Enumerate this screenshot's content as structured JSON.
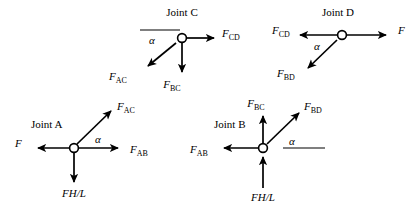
{
  "figure": {
    "type": "free-body-diagram",
    "background_color": "#ffffff",
    "line_color": "#000000",
    "angle_symbol": "α"
  },
  "joints": {
    "c": {
      "title": "Joint C",
      "node": {
        "x": 182,
        "y": 38
      },
      "forces": [
        {
          "name": "F_CD",
          "base": "F",
          "sub": "CD",
          "label_x": 222,
          "label_y": 37,
          "direction": "right",
          "tip_x": 214,
          "tip_y": 38
        },
        {
          "name": "F_BC",
          "base": "F",
          "sub": "BC",
          "label_x": 172,
          "label_y": 88,
          "direction": "down",
          "tip_x": 182,
          "tip_y": 72
        },
        {
          "name": "F_AC",
          "base": "F",
          "sub": "AC",
          "label_x": 118,
          "label_y": 80,
          "direction": "down-left",
          "tip_x": 148,
          "tip_y": 66
        }
      ],
      "angle": {
        "symbol": "α",
        "x": 149,
        "y": 44,
        "ref_line_from_x": 140,
        "ref_line_to_x": 180,
        "ref_line_y": 30
      }
    },
    "d": {
      "title": "Joint D",
      "node": {
        "x": 342,
        "y": 35
      },
      "forces": [
        {
          "name": "F",
          "base": "F",
          "sub": "",
          "label_x": 398,
          "label_y": 34,
          "direction": "right",
          "tip_x": 386,
          "tip_y": 35
        },
        {
          "name": "F_CD",
          "base": "F",
          "sub": "CD",
          "label_x": 272,
          "label_y": 34,
          "direction": "left",
          "tip_x": 300,
          "tip_y": 35
        },
        {
          "name": "F_BD",
          "base": "F",
          "sub": "BD",
          "label_x": 277,
          "label_y": 76,
          "direction": "down-left",
          "tip_x": 308,
          "tip_y": 68
        }
      ],
      "angle": {
        "symbol": "α",
        "x": 315,
        "y": 49,
        "ref_line_from_x": 300,
        "ref_line_to_x": 340,
        "ref_line_y": 35
      }
    },
    "a": {
      "title": "Joint A",
      "title_x": 31,
      "title_y": 128,
      "node": {
        "x": 74,
        "y": 148
      },
      "forces": [
        {
          "name": "F",
          "base": "F",
          "sub": "",
          "label_x": 15,
          "label_y": 147,
          "direction": "left",
          "tip_x": 38,
          "tip_y": 148
        },
        {
          "name": "F_AB",
          "base": "F",
          "sub": "AB",
          "label_x": 132,
          "label_y": 152,
          "direction": "right",
          "tip_x": 118,
          "tip_y": 148
        },
        {
          "name": "F_AC",
          "base": "F",
          "sub": "AC",
          "label_x": 119,
          "label_y": 111,
          "direction": "up-right",
          "tip_x": 111,
          "tip_y": 111
        },
        {
          "name": "FH/L",
          "base": "FH/L",
          "sub": "",
          "label_x": 57,
          "label_y": 196,
          "direction": "down",
          "tip_x": 74,
          "tip_y": 182
        }
      ],
      "angle": {
        "symbol": "α",
        "x": 99,
        "y": 142
      }
    },
    "b": {
      "title": "Joint B",
      "title_x": 214,
      "title_y": 128,
      "node": {
        "x": 263,
        "y": 148
      },
      "forces": [
        {
          "name": "F_AB",
          "base": "F",
          "sub": "AB",
          "label_x": 190,
          "label_y": 152,
          "direction": "left",
          "tip_x": 224,
          "tip_y": 148
        },
        {
          "name": "F_BC",
          "base": "F",
          "sub": "BC",
          "label_x": 255,
          "label_y": 105,
          "direction": "up",
          "tip_x": 263,
          "tip_y": 116
        },
        {
          "name": "F_BD",
          "base": "F",
          "sub": "BD",
          "label_x": 306,
          "label_y": 110,
          "direction": "up-right",
          "tip_x": 299,
          "tip_y": 113
        },
        {
          "name": "FH/L",
          "base": "FH/L",
          "sub": "",
          "label_x": 246,
          "label_y": 200,
          "direction": "up-into-node",
          "tip_x": 263,
          "tip_y": 160
        }
      ],
      "angle": {
        "symbol": "α",
        "x": 291,
        "y": 144,
        "ref_line_from_x": 283,
        "ref_line_to_x": 325,
        "ref_line_y": 148
      }
    }
  }
}
